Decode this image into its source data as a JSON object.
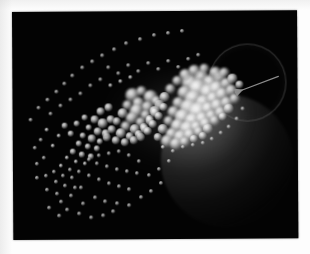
{
  "figure": {
    "kind": "scientific-visualization-photograph",
    "title": "",
    "caption": "",
    "background_color": "#030303",
    "paper_color": "#fdfdfd",
    "plate": {
      "left": 12,
      "top": 12,
      "width": 285,
      "height": 228,
      "rotation_deg": -0.35
    },
    "annotation": {
      "arrow_label": "",
      "arrow_color": "#8c8c8c",
      "arrow_from": [
        266,
        66
      ],
      "arrow_to": [
        231,
        79
      ],
      "points_toward": "particle-cluster"
    },
    "objects": [
      {
        "name": "body-sphere",
        "type": "shaded-sphere",
        "cx": 214,
        "cy": 150,
        "r": 66,
        "color": "#808080",
        "lit_from": "upper-left"
      },
      {
        "name": "halo-ring",
        "type": "faint-circle-outline",
        "cx": 234,
        "cy": 71,
        "r": 38,
        "color": "#767676"
      },
      {
        "name": "cluster-glow",
        "type": "diffuse-glow",
        "cx": 162,
        "cy": 108,
        "rx": 70,
        "ry": 52,
        "color": "#969696"
      }
    ],
    "particle_field": {
      "color": "#ffffff",
      "count_visible": 208,
      "distribution": "cone-shaped stream, dense at right near sphere, sparse fanning to lower-left",
      "size_range_px": [
        1.6,
        11.5
      ]
    }
  },
  "chart_data": {
    "type": "scatter",
    "title": "",
    "xlabel": "",
    "ylabel": "",
    "xlim": [
      0,
      285
    ],
    "ylim": [
      0,
      228
    ],
    "grid": false,
    "legend": null,
    "series": [
      {
        "name": "particles",
        "points": [
          [
            178,
            72,
            9.0
          ],
          [
            189,
            66,
            7.2
          ],
          [
            198,
            72,
            8.4
          ],
          [
            207,
            67,
            6.4
          ],
          [
            186,
            78,
            10.0
          ],
          [
            196,
            82,
            8.8
          ],
          [
            205,
            78,
            7.6
          ],
          [
            214,
            73,
            6.0
          ],
          [
            172,
            82,
            7.0
          ],
          [
            181,
            88,
            9.4
          ],
          [
            191,
            92,
            8.0
          ],
          [
            201,
            88,
            7.2
          ],
          [
            210,
            84,
            6.6
          ],
          [
            219,
            80,
            5.6
          ],
          [
            166,
            92,
            6.2
          ],
          [
            176,
            97,
            8.6
          ],
          [
            186,
            101,
            9.8
          ],
          [
            196,
            98,
            7.4
          ],
          [
            205,
            95,
            6.8
          ],
          [
            214,
            92,
            6.0
          ],
          [
            222,
            88,
            5.0
          ],
          [
            161,
            101,
            5.8
          ],
          [
            170,
            106,
            7.8
          ],
          [
            180,
            110,
            8.2
          ],
          [
            190,
            108,
            7.0
          ],
          [
            199,
            105,
            6.2
          ],
          [
            208,
            102,
            5.6
          ],
          [
            216,
            98,
            4.8
          ],
          [
            156,
            110,
            5.2
          ],
          [
            165,
            115,
            7.0
          ],
          [
            175,
            118,
            7.6
          ],
          [
            184,
            116,
            6.4
          ],
          [
            193,
            113,
            5.8
          ],
          [
            202,
            110,
            5.0
          ],
          [
            210,
            106,
            4.4
          ],
          [
            150,
            118,
            4.8
          ],
          [
            159,
            123,
            6.2
          ],
          [
            168,
            126,
            6.8
          ],
          [
            177,
            124,
            5.8
          ],
          [
            186,
            121,
            5.2
          ],
          [
            195,
            118,
            4.6
          ],
          [
            145,
            126,
            4.4
          ],
          [
            154,
            130,
            5.6
          ],
          [
            163,
            133,
            6.0
          ],
          [
            172,
            131,
            5.0
          ],
          [
            181,
            128,
            4.4
          ],
          [
            190,
            125,
            4.0
          ],
          [
            203,
            62,
            5.6
          ],
          [
            212,
            62,
            5.0
          ],
          [
            220,
            68,
            4.6
          ],
          [
            227,
            74,
            4.2
          ],
          [
            192,
            58,
            5.2
          ],
          [
            182,
            60,
            5.8
          ],
          [
            173,
            64,
            6.2
          ],
          [
            165,
            70,
            5.4
          ],
          [
            158,
            78,
            5.0
          ],
          [
            152,
            86,
            4.8
          ],
          [
            147,
            94,
            4.6
          ],
          [
            142,
            102,
            4.4
          ],
          [
            137,
            110,
            4.2
          ],
          [
            132,
            118,
            4.0
          ],
          [
            128,
            126,
            3.8
          ],
          [
            120,
            84,
            6.6
          ],
          [
            129,
            80,
            5.4
          ],
          [
            138,
            86,
            7.0
          ],
          [
            126,
            92,
            6.2
          ],
          [
            135,
            96,
            5.6
          ],
          [
            144,
            90,
            5.0
          ],
          [
            115,
            94,
            5.2
          ],
          [
            124,
            100,
            6.8
          ],
          [
            133,
            104,
            5.0
          ],
          [
            142,
            100,
            4.6
          ],
          [
            151,
            96,
            4.4
          ],
          [
            110,
            102,
            4.8
          ],
          [
            119,
            107,
            6.0
          ],
          [
            128,
            111,
            5.2
          ],
          [
            137,
            108,
            4.4
          ],
          [
            146,
            105,
            4.2
          ],
          [
            104,
            110,
            4.4
          ],
          [
            113,
            115,
            5.4
          ],
          [
            122,
            118,
            4.8
          ],
          [
            131,
            116,
            4.2
          ],
          [
            140,
            113,
            3.8
          ],
          [
            99,
            118,
            4.0
          ],
          [
            108,
            122,
            4.8
          ],
          [
            117,
            125,
            4.4
          ],
          [
            126,
            123,
            3.8
          ],
          [
            135,
            120,
            3.6
          ],
          [
            94,
            126,
            3.8
          ],
          [
            103,
            129,
            4.4
          ],
          [
            112,
            131,
            4.0
          ],
          [
            121,
            129,
            3.6
          ],
          [
            88,
            100,
            4.2
          ],
          [
            96,
            96,
            3.8
          ],
          [
            82,
            108,
            3.6
          ],
          [
            90,
            112,
            4.6
          ],
          [
            98,
            108,
            4.0
          ],
          [
            76,
            116,
            3.4
          ],
          [
            85,
            120,
            4.0
          ],
          [
            93,
            122,
            3.8
          ],
          [
            70,
            124,
            3.2
          ],
          [
            79,
            127,
            3.6
          ],
          [
            87,
            130,
            3.4
          ],
          [
            64,
            112,
            3.0
          ],
          [
            72,
            106,
            2.8
          ],
          [
            66,
            132,
            3.0
          ],
          [
            75,
            135,
            3.2
          ],
          [
            84,
            137,
            3.0
          ],
          [
            58,
            122,
            2.8
          ],
          [
            52,
            114,
            2.6
          ],
          [
            60,
            140,
            2.8
          ],
          [
            69,
            143,
            2.6
          ],
          [
            78,
            145,
            2.6
          ],
          [
            46,
            124,
            2.4
          ],
          [
            40,
            134,
            2.3
          ],
          [
            54,
            146,
            2.4
          ],
          [
            63,
            150,
            2.3
          ],
          [
            72,
            152,
            2.2
          ],
          [
            34,
            118,
            2.2
          ],
          [
            28,
            128,
            2.1
          ],
          [
            48,
            154,
            2.2
          ],
          [
            57,
            158,
            2.1
          ],
          [
            66,
            160,
            2.0
          ],
          [
            22,
            136,
            2.0
          ],
          [
            31,
            146,
            2.0
          ],
          [
            41,
            160,
            2.0
          ],
          [
            50,
            164,
            1.9
          ],
          [
            59,
            166,
            1.9
          ],
          [
            24,
            152,
            1.9
          ],
          [
            33,
            164,
            1.9
          ],
          [
            43,
            170,
            1.8
          ],
          [
            52,
            174,
            1.8
          ],
          [
            62,
            176,
            1.8
          ],
          [
            18,
            108,
            1.9
          ],
          [
            26,
            96,
            1.9
          ],
          [
            35,
            88,
            1.8
          ],
          [
            44,
            80,
            1.8
          ],
          [
            52,
            72,
            1.8
          ],
          [
            60,
            64,
            1.8
          ],
          [
            70,
            56,
            1.8
          ],
          [
            80,
            50,
            1.8
          ],
          [
            90,
            44,
            1.8
          ],
          [
            102,
            38,
            1.8
          ],
          [
            114,
            32,
            1.8
          ],
          [
            128,
            28,
            1.8
          ],
          [
            142,
            24,
            1.8
          ],
          [
            156,
            22,
            1.8
          ],
          [
            170,
            20,
            1.8
          ],
          [
            96,
            56,
            2.0
          ],
          [
            106,
            62,
            2.1
          ],
          [
            116,
            54,
            2.0
          ],
          [
            126,
            60,
            2.1
          ],
          [
            136,
            52,
            2.0
          ],
          [
            146,
            58,
            2.1
          ],
          [
            156,
            50,
            2.0
          ],
          [
            166,
            56,
            2.0
          ],
          [
            176,
            48,
            1.9
          ],
          [
            186,
            44,
            1.9
          ],
          [
            108,
            70,
            2.4
          ],
          [
            118,
            66,
            2.3
          ],
          [
            98,
            74,
            2.2
          ],
          [
            88,
            68,
            2.1
          ],
          [
            78,
            74,
            2.0
          ],
          [
            68,
            82,
            2.0
          ],
          [
            58,
            88,
            1.9
          ],
          [
            48,
            94,
            1.9
          ],
          [
            38,
            102,
            1.9
          ],
          [
            84,
            152,
            2.0
          ],
          [
            94,
            155,
            2.0
          ],
          [
            104,
            158,
            1.9
          ],
          [
            114,
            160,
            1.9
          ],
          [
            124,
            162,
            1.9
          ],
          [
            76,
            164,
            1.9
          ],
          [
            86,
            168,
            1.9
          ],
          [
            96,
            172,
            1.9
          ],
          [
            106,
            175,
            1.8
          ],
          [
            116,
            178,
            1.8
          ],
          [
            68,
            176,
            1.8
          ],
          [
            58,
            184,
            1.8
          ],
          [
            48,
            190,
            1.8
          ],
          [
            70,
            192,
            1.8
          ],
          [
            82,
            186,
            1.8
          ],
          [
            92,
            190,
            1.8
          ],
          [
            104,
            192,
            1.8
          ],
          [
            116,
            194,
            1.8
          ],
          [
            128,
            186,
            1.8
          ],
          [
            138,
            180,
            1.8
          ],
          [
            148,
            172,
            1.8
          ],
          [
            136,
            164,
            1.9
          ],
          [
            146,
            158,
            1.9
          ],
          [
            156,
            150,
            1.9
          ],
          [
            126,
            150,
            2.0
          ],
          [
            116,
            144,
            2.0
          ],
          [
            106,
            140,
            2.1
          ],
          [
            96,
            142,
            2.0
          ],
          [
            86,
            144,
            2.0
          ],
          [
            76,
            148,
            1.9
          ],
          [
            150,
            136,
            2.2
          ],
          [
            160,
            140,
            2.1
          ],
          [
            170,
            136,
            2.0
          ],
          [
            180,
            134,
            2.0
          ],
          [
            190,
            132,
            1.9
          ],
          [
            199,
            128,
            1.9
          ],
          [
            208,
            122,
            1.9
          ],
          [
            216,
            116,
            1.9
          ],
          [
            224,
            108,
            1.9
          ],
          [
            230,
            98,
            1.9
          ],
          [
            34,
            178,
            1.8
          ],
          [
            44,
            182,
            1.8
          ],
          [
            24,
            166,
            1.8
          ],
          [
            54,
            198,
            1.8
          ],
          [
            66,
            202,
            1.8
          ],
          [
            78,
            206,
            1.8
          ],
          [
            90,
            204,
            1.8
          ],
          [
            100,
            200,
            1.8
          ],
          [
            36,
            196,
            1.7
          ],
          [
            46,
            204,
            1.7
          ]
        ]
      }
    ]
  }
}
